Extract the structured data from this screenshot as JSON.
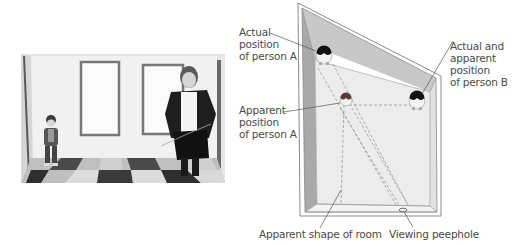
{
  "figure": {
    "type": "Ames room illustration",
    "photo": {
      "description": "Photograph of two children standing in an Ames room; small child on left, taller child on right",
      "subjects": [
        "small child (left)",
        "tall child (right)"
      ]
    },
    "diagram": {
      "labels": {
        "actual_a": [
          "Actual",
          "position",
          "of person A"
        ],
        "apparent_a": [
          "Apparent",
          "position",
          "of person A"
        ],
        "person_b": [
          "Actual and",
          "apparent",
          "position",
          "of person B"
        ],
        "room_shape": "Apparent shape of room",
        "peephole": "Viewing peephole"
      },
      "colors": {
        "wall_shade": "#c8c8c8",
        "wall_dark": "#a9a9a9",
        "floor": "#ececec",
        "outline": "#8a8a8a",
        "dash": "#9a9a9a",
        "head": "#111111",
        "text": "#4a4a4a"
      }
    }
  }
}
